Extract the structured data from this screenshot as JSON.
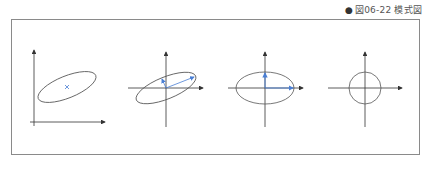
{
  "caption": {
    "bullet": "●",
    "label": "図06-22 模式図"
  },
  "colors": {
    "axis": "#333333",
    "ellipse": "#555555",
    "accent": "#4a7fd4",
    "frame": "#8a8a8a"
  },
  "panels": [
    {
      "name": "original-data-distribution",
      "description": "Tilted ellipse with mean marked by x in first quadrant axes"
    },
    {
      "name": "centered-with-eigenvectors",
      "description": "Tilted ellipse centered on origin with two principal-axis vectors"
    },
    {
      "name": "rotated-decorrelated",
      "description": "Axis-aligned ellipse with principal vectors along axes"
    },
    {
      "name": "whitened",
      "description": "Circle centered on origin"
    }
  ]
}
